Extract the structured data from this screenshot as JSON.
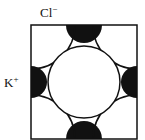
{
  "labels": {
    "anion": "Cl",
    "anion_charge": "−",
    "cation": "K",
    "cation_charge": "+"
  },
  "colors": {
    "line": "#111111",
    "fill_cation": "#111111",
    "background": "#ffffff"
  }
}
